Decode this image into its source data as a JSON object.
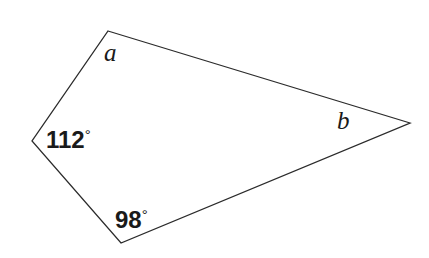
{
  "figure": {
    "kind": "geometry-diagram",
    "shape": "quadrilateral",
    "background_color": "#ffffff",
    "stroke_color": "#2b2b2b",
    "stroke_width": 1.3,
    "width": 429,
    "height": 258,
    "vertices": [
      {
        "id": "top",
        "x": 108,
        "y": 31
      },
      {
        "id": "right",
        "x": 410,
        "y": 123
      },
      {
        "id": "bottom",
        "x": 121,
        "y": 243
      },
      {
        "id": "left",
        "x": 32,
        "y": 141
      }
    ],
    "path": "M 108 31 L 410 123 L 121 243 L 32 141 Z"
  },
  "labels": {
    "a": {
      "text": "a",
      "at_vertex": "top",
      "style": "italic-serif"
    },
    "b": {
      "text": "b",
      "at_vertex": "right",
      "style": "italic-serif"
    },
    "angle_left": {
      "value": "112",
      "degree_symbol": "°",
      "text": "112°",
      "at_vertex": "left"
    },
    "angle_bottom": {
      "value": "98",
      "degree_symbol": "°",
      "text": "98°",
      "at_vertex": "bottom"
    }
  }
}
